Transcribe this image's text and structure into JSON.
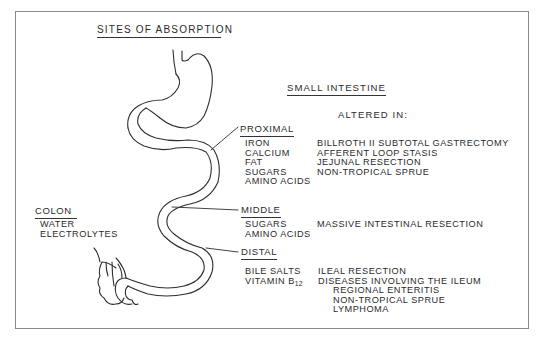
{
  "title": "SITES OF ABSORPTION",
  "small_intestine": {
    "heading": "SMALL INTESTINE",
    "altered_in_label": "ALTERED IN:",
    "sections": [
      {
        "name": "PROXIMAL",
        "absorbs": [
          "IRON",
          "CALCIUM",
          "FAT",
          "SUGARS",
          "AMINO ACIDS"
        ],
        "altered_in": [
          "BILLROTH II SUBTOTAL GASTRECTOMY",
          "AFFERENT LOOP STASIS",
          "JEJUNAL RESECTION",
          "NON-TROPICAL SPRUE"
        ]
      },
      {
        "name": "MIDDLE",
        "absorbs": [
          "SUGARS",
          "AMINO ACIDS"
        ],
        "altered_in": [
          "MASSIVE INTESTINAL RESECTION"
        ]
      },
      {
        "name": "DISTAL",
        "absorbs": [
          "BILE SALTS",
          "VITAMIN B",
          "12"
        ],
        "altered_in": [
          "ILEAL RESECTION",
          "DISEASES INVOLVING THE ILEUM"
        ],
        "altered_in_sub": [
          "REGIONAL ENTERITIS",
          "NON-TROPICAL SPRUE",
          "LYMPHOMA"
        ]
      }
    ]
  },
  "colon": {
    "name": "COLON",
    "absorbs": [
      "WATER",
      "ELECTROLYTES"
    ]
  }
}
